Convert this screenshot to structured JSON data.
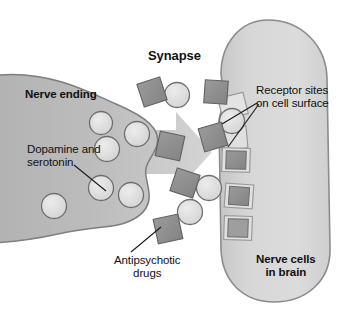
{
  "figure": {
    "background_color": "#ffffff"
  },
  "labels": {
    "synapse": "Synapse",
    "nerve_ending": "Nerve ending",
    "dopamine_serotonin": "Dopamine and\nserotonin",
    "receptor_sites": "Receptor sites\non cell surface",
    "antipsychotic_drugs": "Antipsychotic\ndrugs",
    "nerve_cells": "Nerve cells\nin brain"
  },
  "colors": {
    "nerve_ending_fill": "#b6b6b6",
    "nerve_ending_stroke": "#7e7e7e",
    "brain_cell_fill": "#d6d6d6",
    "brain_cell_stroke": "#8c8c8c",
    "vesicle_fill": "#dedede",
    "vesicle_stroke": "#6f6f6f",
    "drug_square_fill": "#8f8f8f",
    "drug_square_stroke": "#5e5e5e",
    "receptor_notch_fill": "#cfcfcf",
    "receptor_notch_stroke": "#8a8a8a",
    "arrow_fill": "#c9c9c9",
    "leader_line": "#1a1a1a",
    "text": "#111111"
  },
  "elements": {
    "nerve_ending": {
      "name": "presynaptic nerve ending",
      "side": "left"
    },
    "brain_cell": {
      "name": "postsynaptic nerve cell in brain",
      "side": "right"
    },
    "release_arrow": {
      "name": "neurotransmitter release arrow",
      "direction": "right"
    },
    "vesicles": [
      {
        "cx": 101,
        "cy": 123,
        "r": 12
      },
      {
        "cx": 108,
        "cy": 149,
        "r": 13
      },
      {
        "cx": 137,
        "cy": 134,
        "r": 13
      },
      {
        "cx": 101,
        "cy": 187,
        "r": 13
      },
      {
        "cx": 131,
        "cy": 194,
        "r": 13
      },
      {
        "cx": 54,
        "cy": 205,
        "r": 13
      },
      {
        "cx": 177,
        "cy": 95,
        "r": 13
      },
      {
        "cx": 232,
        "cy": 121,
        "r": 13
      },
      {
        "cx": 208,
        "cy": 188,
        "r": 13
      },
      {
        "cx": 190,
        "cy": 212,
        "r": 13
      }
    ],
    "drug_squares": [
      {
        "cx": 152,
        "cy": 92,
        "size": 24,
        "rot": -18
      },
      {
        "cx": 170,
        "cy": 146,
        "size": 25,
        "rot": 12
      },
      {
        "cx": 216,
        "cy": 92,
        "size": 23,
        "rot": 4
      },
      {
        "cx": 213,
        "cy": 137,
        "size": 24,
        "rot": -16
      },
      {
        "cx": 185,
        "cy": 183,
        "size": 24,
        "rot": 18
      },
      {
        "cx": 168,
        "cy": 229,
        "size": 25,
        "rot": -12
      }
    ],
    "receptor_notches": [
      {
        "cx": 237,
        "cy": 110,
        "w": 24,
        "h": 22,
        "rot": -14
      },
      {
        "cx": 237,
        "cy": 141,
        "w": 25,
        "h": 23,
        "rot": -6
      },
      {
        "cx": 237,
        "cy": 162,
        "w": 26,
        "h": 24,
        "rot": 2
      },
      {
        "cx": 241,
        "cy": 196,
        "w": 26,
        "h": 24,
        "rot": 4
      },
      {
        "cx": 240,
        "cy": 228,
        "w": 26,
        "h": 24,
        "rot": 2
      }
    ],
    "leader_lines": [
      {
        "name": "dopamine-leader",
        "from": [
          74,
          166
        ],
        "to": [
          105,
          190
        ]
      },
      {
        "name": "receptor-leader-upper",
        "from": [
          256,
          102
        ],
        "to": [
          223,
          124
        ]
      },
      {
        "name": "receptor-leader-lower",
        "from": [
          258,
          103
        ],
        "to": [
          228,
          146
        ]
      },
      {
        "name": "antipsychotic-leader",
        "from": [
          132,
          252
        ],
        "to": [
          160,
          228
        ]
      }
    ]
  }
}
